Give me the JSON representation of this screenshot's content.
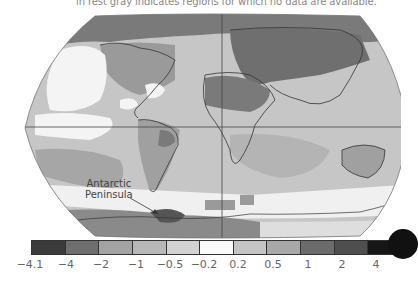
{
  "caption": "in rest gray indicates regions for which no data are available.",
  "map": {
    "projection": "robinson-like",
    "annotation": {
      "line1": "Antarctic",
      "line2": "Peninsula"
    },
    "gridlines": {
      "equator": true,
      "prime_meridian": true
    }
  },
  "colorbar": {
    "segments": [
      "#3a3a3a",
      "#6e6e6e",
      "#a3a3a3",
      "#b7b7b7",
      "#d2d2d2",
      "#fafafa",
      "#c4c4c4",
      "#a8a8a8",
      "#6b6b6b",
      "#4f4f4f",
      "#161616"
    ],
    "labels": [
      "−4.1",
      "−4",
      "−2",
      "−1",
      "−0.5",
      "−0.2",
      "0.2",
      "0.5",
      "1",
      "2",
      "4"
    ]
  }
}
